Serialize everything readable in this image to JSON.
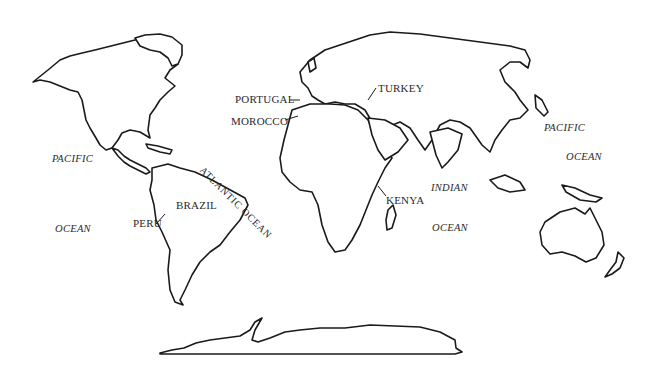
{
  "map": {
    "type": "outline world map",
    "countries": [
      {
        "name": "PORTUGAL",
        "x": 235,
        "y": 94
      },
      {
        "name": "MOROCCO",
        "x": 231,
        "y": 116
      },
      {
        "name": "TURKEY",
        "x": 378,
        "y": 83
      },
      {
        "name": "BRAZIL",
        "x": 193,
        "y": 200
      },
      {
        "name": "PERU",
        "x": 133,
        "y": 218
      },
      {
        "name": "KENYA",
        "x": 386,
        "y": 195
      }
    ],
    "oceans": [
      {
        "name": "PACIFIC",
        "x": 52,
        "y": 154
      },
      {
        "name": "OCEAN",
        "x": 55,
        "y": 224
      },
      {
        "name": "ATLANTIC OCEAN",
        "x": 213,
        "y": 160,
        "rotate": 45
      },
      {
        "name": "INDIAN",
        "x": 431,
        "y": 183
      },
      {
        "name": "OCEAN",
        "x": 432,
        "y": 223
      },
      {
        "name": "PACIFIC",
        "x": 544,
        "y": 123
      },
      {
        "name": "OCEAN",
        "x": 566,
        "y": 152
      }
    ]
  }
}
